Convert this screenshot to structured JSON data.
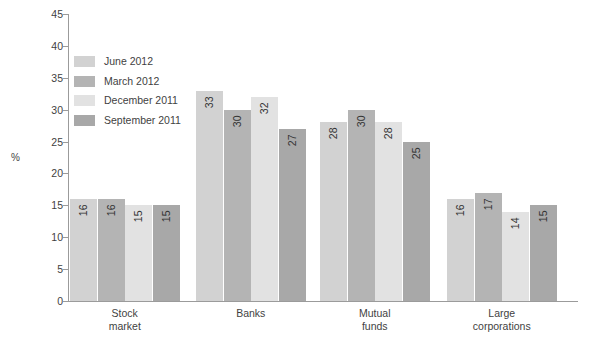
{
  "chart_data": {
    "type": "bar",
    "title": "",
    "xlabel": "",
    "ylabel": "%",
    "ylim": [
      0,
      45
    ],
    "ytick_step": 5,
    "yticks": [
      "45",
      "40",
      "35",
      "30",
      "25",
      "20",
      "15",
      "10",
      "5",
      "0"
    ],
    "grid": false,
    "legend_position": "upper-left-inside",
    "categories": [
      "Stock market",
      "Banks",
      "Mutual funds",
      "Large corporations"
    ],
    "category_lines": [
      [
        "Stock",
        "market"
      ],
      [
        "Banks"
      ],
      [
        "Mutual",
        "funds"
      ],
      [
        "Large",
        "corporations"
      ]
    ],
    "series": [
      {
        "name": "June 2012",
        "color": "#d2d2d2",
        "values": [
          16,
          33,
          28,
          16
        ]
      },
      {
        "name": "March 2012",
        "color": "#b4b4b4",
        "values": [
          16,
          30,
          30,
          17
        ]
      },
      {
        "name": "December 2011",
        "color": "#e2e2e2",
        "values": [
          15,
          32,
          28,
          14
        ]
      },
      {
        "name": "September 2011",
        "color": "#a8a8a8",
        "values": [
          15,
          27,
          25,
          15
        ]
      }
    ]
  },
  "axis": {
    "y_title": "%"
  }
}
